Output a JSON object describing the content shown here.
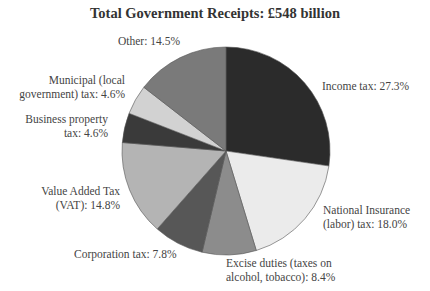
{
  "chart_data": {
    "type": "pie",
    "title": "Total Government Receipts: £548 billion",
    "start_angle_deg": 0,
    "direction": "clockwise",
    "slices": [
      {
        "name": "Income tax",
        "value": 27.3,
        "color": "#2b2b2b",
        "label_lines": [
          "Income tax: 27.3%"
        ],
        "label_x": 322,
        "label_y": 90,
        "anchor": "start"
      },
      {
        "name": "National Insurance (labor) tax",
        "value": 18.0,
        "color": "#ebebeb",
        "label_lines": [
          "National Insurance",
          "(labor) tax: 18.0%"
        ],
        "label_x": 323,
        "label_y": 214,
        "anchor": "start"
      },
      {
        "name": "Excise duties (taxes on alcohol, tobacco)",
        "value": 8.4,
        "color": "#8c8c8c",
        "label_lines": [
          "Excise duties (taxes on",
          "alcohol, tobacco): 8.4%"
        ],
        "label_x": 226,
        "label_y": 267,
        "anchor": "start"
      },
      {
        "name": "Corporation tax",
        "value": 7.8,
        "color": "#575757",
        "label_lines": [
          "Corporation tax: 7.8%"
        ],
        "label_x": 74,
        "label_y": 258,
        "anchor": "start"
      },
      {
        "name": "Value Added Tax (VAT)",
        "value": 14.8,
        "color": "#b4b4b4",
        "label_lines": [
          "Value Added Tax",
          "(VAT): 14.8%"
        ],
        "label_x": 120,
        "label_y": 195,
        "anchor": "end"
      },
      {
        "name": "Business property tax",
        "value": 4.6,
        "color": "#3a3a3a",
        "label_lines": [
          "Business property",
          "tax: 4.6%"
        ],
        "label_x": 108,
        "label_y": 123,
        "anchor": "end"
      },
      {
        "name": "Municipal (local government) tax",
        "value": 4.6,
        "color": "#d2d2d2",
        "label_lines": [
          "Municipal (local",
          "government) tax: 4.6%"
        ],
        "label_x": 125,
        "label_y": 84,
        "anchor": "end"
      },
      {
        "name": "Other",
        "value": 14.5,
        "color": "#7a7a7a",
        "label_lines": [
          "Other: 14.5%"
        ],
        "label_x": 118,
        "label_y": 45,
        "anchor": "start"
      }
    ],
    "units": "%",
    "total": "£548 billion",
    "legend": "none (direct labels)"
  },
  "layout": {
    "cx": 226,
    "cy": 151,
    "r": 104
  }
}
